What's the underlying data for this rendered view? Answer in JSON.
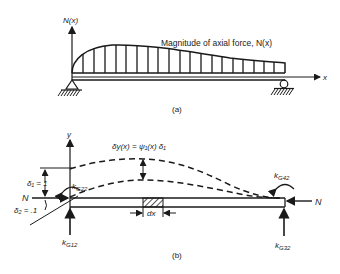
{
  "figure_a": {
    "axis_label": "N(x)",
    "x_axis_label": "x",
    "annotation": "Magnitude of axial force, N(x)",
    "caption": "(a)"
  },
  "figure_b": {
    "y_axis_label": "y",
    "deflection_label": "δy(x) = ψ₁(x) δ₁",
    "delta1_label": "δ₁ = 1",
    "delta2_label": "δ₂ = .1",
    "force_left_label": "N",
    "force_right_label": "N",
    "k22_label": "k",
    "k22_sub": "G22",
    "k42_label": "k",
    "k42_sub": "G42",
    "k12_label": "k",
    "k12_sub": "G12",
    "k32_label": "k",
    "k32_sub": "G32",
    "dx_label": "dx",
    "caption": "(b)"
  },
  "colors": {
    "ink": "#1a1a1a",
    "background": "#ffffff"
  }
}
